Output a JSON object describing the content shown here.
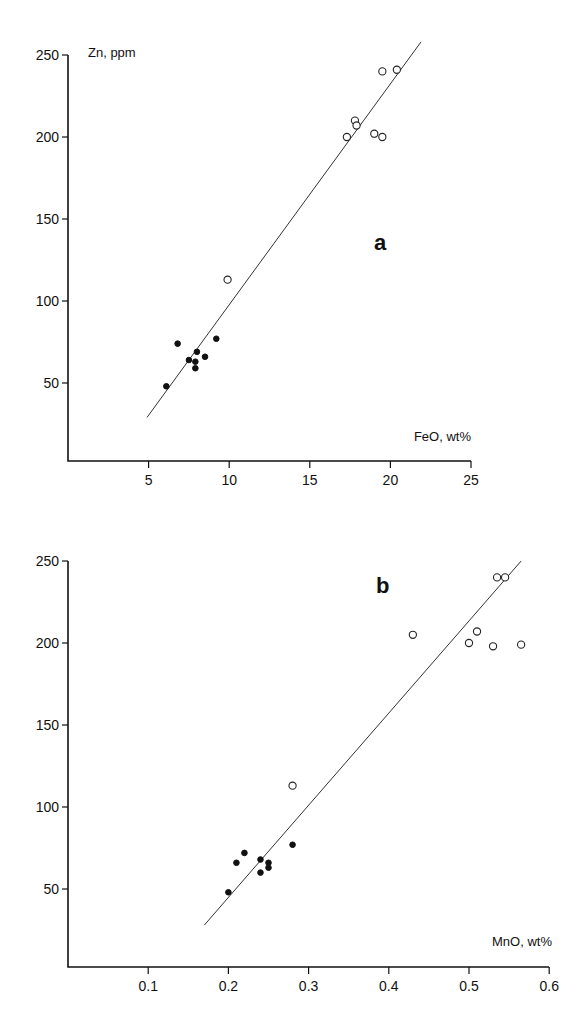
{
  "chart_data": [
    {
      "type": "scatter",
      "panel_label": "a",
      "title": "",
      "xlabel": "FeO, wt%",
      "ylabel": "Zn, ppm",
      "xlim": [
        0,
        25
      ],
      "ylim": [
        0,
        250
      ],
      "xticks": [
        5,
        10,
        15,
        20,
        25
      ],
      "yticks": [
        50,
        100,
        150,
        200,
        250
      ],
      "grid": false,
      "series": [
        {
          "name": "filled",
          "marker": "filled-circle",
          "points": [
            [
              6.1,
              48
            ],
            [
              6.8,
              74
            ],
            [
              8.0,
              69
            ],
            [
              8.5,
              66
            ],
            [
              7.5,
              64
            ],
            [
              7.9,
              63
            ],
            [
              7.9,
              59
            ],
            [
              9.2,
              77
            ]
          ]
        },
        {
          "name": "open",
          "marker": "open-circle",
          "points": [
            [
              9.9,
              113
            ],
            [
              19.5,
              240
            ],
            [
              20.4,
              241
            ],
            [
              17.8,
              210
            ],
            [
              17.9,
              207
            ],
            [
              17.3,
              200
            ],
            [
              19.0,
              202
            ],
            [
              19.5,
              200
            ]
          ]
        }
      ],
      "fit_line": [
        [
          4.9,
          29
        ],
        [
          21.9,
          258
        ]
      ]
    },
    {
      "type": "scatter",
      "panel_label": "b",
      "title": "",
      "xlabel": "MnO, wt%",
      "ylabel": "",
      "xlim": [
        0,
        0.6
      ],
      "ylim": [
        0,
        250
      ],
      "xticks": [
        0.1,
        0.2,
        0.3,
        0.4,
        0.5,
        0.6
      ],
      "yticks": [
        50,
        100,
        150,
        200,
        250
      ],
      "grid": false,
      "series": [
        {
          "name": "filled",
          "marker": "filled-circle",
          "points": [
            [
              0.2,
              48
            ],
            [
              0.21,
              66
            ],
            [
              0.22,
              72
            ],
            [
              0.24,
              68
            ],
            [
              0.24,
              60
            ],
            [
              0.25,
              66
            ],
            [
              0.25,
              63
            ],
            [
              0.28,
              77
            ]
          ]
        },
        {
          "name": "open",
          "marker": "open-circle",
          "points": [
            [
              0.28,
              113
            ],
            [
              0.535,
              240
            ],
            [
              0.545,
              240
            ],
            [
              0.43,
              205
            ],
            [
              0.51,
              207
            ],
            [
              0.5,
              200
            ],
            [
              0.53,
              198
            ],
            [
              0.565,
              199
            ]
          ]
        }
      ],
      "fit_line": [
        [
          0.17,
          28
        ],
        [
          0.565,
          250
        ]
      ]
    }
  ],
  "layout": [
    {
      "x0px": 68,
      "xscale": 16.12,
      "y0px": 465,
      "yscale": 1.64,
      "axis_top": 55,
      "axis_right": 471,
      "panel_label_pos": [
        374,
        250
      ],
      "xlabel_pos": [
        471,
        441
      ],
      "ylabel_pos": [
        88,
        57
      ]
    },
    {
      "x0px": 68,
      "xscale": 802,
      "y0px": 971,
      "yscale": 1.64,
      "axis_top": 561,
      "axis_right": 549,
      "panel_label_pos": [
        376,
        593
      ],
      "xlabel_pos": [
        552,
        946
      ],
      "ylabel_pos": null
    }
  ]
}
